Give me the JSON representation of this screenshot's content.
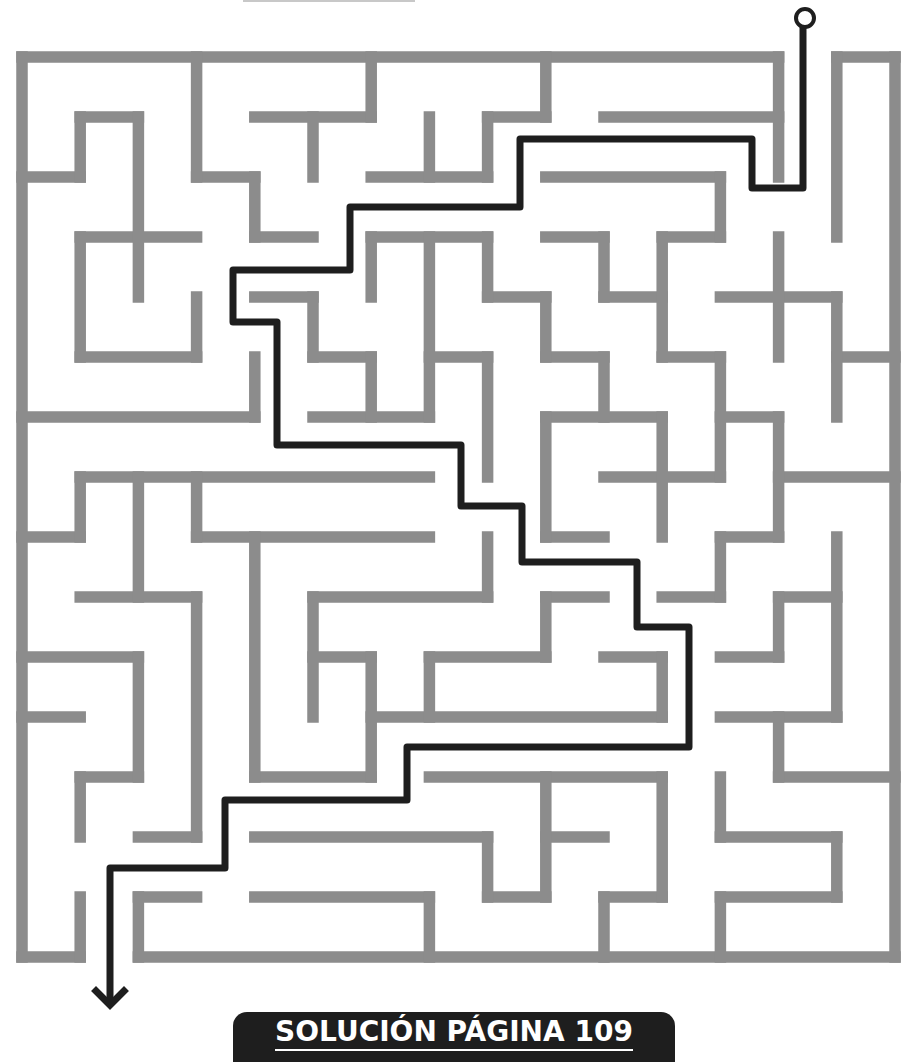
{
  "puzzle": {
    "type": "maze",
    "grid": {
      "cols": 15,
      "rows": 15
    },
    "wall_color": "#8c8c8c",
    "path_color": "#1e1e1e",
    "entrance": "top, between column lines 13 and 14",
    "exit": "bottom, between column lines 1 and 2"
  },
  "walls": {
    "horizontal": [
      [
        0,
        0,
        13
      ],
      [
        0,
        14,
        15
      ],
      [
        1,
        1,
        2
      ],
      [
        1,
        4,
        6
      ],
      [
        1,
        8,
        9
      ],
      [
        1,
        10,
        13
      ],
      [
        2,
        0,
        1
      ],
      [
        2,
        3,
        4
      ],
      [
        2,
        6,
        8
      ],
      [
        2,
        9,
        12
      ],
      [
        3,
        1,
        3
      ],
      [
        3,
        4,
        5
      ],
      [
        3,
        6,
        8
      ],
      [
        3,
        9,
        10
      ],
      [
        3,
        11,
        12
      ],
      [
        4,
        4,
        5
      ],
      [
        4,
        8,
        9
      ],
      [
        4,
        10,
        11
      ],
      [
        4,
        12,
        14
      ],
      [
        5,
        1,
        3
      ],
      [
        5,
        5,
        6
      ],
      [
        5,
        7,
        8
      ],
      [
        5,
        9,
        10
      ],
      [
        5,
        11,
        12
      ],
      [
        5,
        14,
        15
      ],
      [
        6,
        0,
        4
      ],
      [
        6,
        5,
        7
      ],
      [
        6,
        9,
        11
      ],
      [
        6,
        12,
        13
      ],
      [
        7,
        1,
        7
      ],
      [
        7,
        10,
        12
      ],
      [
        7,
        13,
        15
      ],
      [
        8,
        0,
        1
      ],
      [
        8,
        3,
        7
      ],
      [
        8,
        9,
        10
      ],
      [
        8,
        12,
        13
      ],
      [
        9,
        1,
        3
      ],
      [
        9,
        5,
        8
      ],
      [
        9,
        9,
        10
      ],
      [
        9,
        11,
        12
      ],
      [
        9,
        13,
        14
      ],
      [
        10,
        0,
        2
      ],
      [
        10,
        5,
        6
      ],
      [
        10,
        7,
        9
      ],
      [
        10,
        10,
        11
      ],
      [
        10,
        12,
        13
      ],
      [
        11,
        0,
        1
      ],
      [
        11,
        6,
        11
      ],
      [
        11,
        12,
        14
      ],
      [
        12,
        1,
        2
      ],
      [
        12,
        4,
        6
      ],
      [
        12,
        7,
        11
      ],
      [
        12,
        13,
        15
      ],
      [
        13,
        2,
        3
      ],
      [
        13,
        4,
        8
      ],
      [
        13,
        9,
        10
      ],
      [
        13,
        12,
        14
      ],
      [
        14,
        2,
        3
      ],
      [
        14,
        4,
        7
      ],
      [
        14,
        8,
        9
      ],
      [
        14,
        10,
        11
      ],
      [
        14,
        12,
        14
      ],
      [
        15,
        0,
        1
      ],
      [
        15,
        2,
        15
      ]
    ],
    "vertical": [
      [
        0,
        0,
        15
      ],
      [
        1,
        1,
        2
      ],
      [
        1,
        3,
        5
      ],
      [
        1,
        7,
        8
      ],
      [
        1,
        12,
        13
      ],
      [
        1,
        14,
        15
      ],
      [
        2,
        1,
        4
      ],
      [
        2,
        7,
        9
      ],
      [
        2,
        10,
        12
      ],
      [
        2,
        14,
        15
      ],
      [
        3,
        0,
        2
      ],
      [
        3,
        4,
        5
      ],
      [
        3,
        7,
        8
      ],
      [
        3,
        9,
        13
      ],
      [
        4,
        2,
        3
      ],
      [
        4,
        5,
        6
      ],
      [
        4,
        8,
        12
      ],
      [
        5,
        1,
        2
      ],
      [
        5,
        4,
        5
      ],
      [
        5,
        9,
        11
      ],
      [
        6,
        0,
        1
      ],
      [
        6,
        3,
        4
      ],
      [
        6,
        5,
        6
      ],
      [
        6,
        10,
        12
      ],
      [
        7,
        1,
        2
      ],
      [
        7,
        3,
        6
      ],
      [
        7,
        10,
        11
      ],
      [
        7,
        14,
        15
      ],
      [
        8,
        1,
        2
      ],
      [
        8,
        3,
        4
      ],
      [
        8,
        5,
        7
      ],
      [
        8,
        8,
        9
      ],
      [
        8,
        13,
        14
      ],
      [
        9,
        0,
        1
      ],
      [
        9,
        4,
        5
      ],
      [
        9,
        6,
        8
      ],
      [
        9,
        9,
        10
      ],
      [
        9,
        12,
        14
      ],
      [
        10,
        3,
        4
      ],
      [
        10,
        5,
        6
      ],
      [
        10,
        14,
        15
      ],
      [
        11,
        3,
        5
      ],
      [
        11,
        6,
        8
      ],
      [
        11,
        10,
        11
      ],
      [
        11,
        12,
        14
      ],
      [
        12,
        2,
        3
      ],
      [
        12,
        5,
        7
      ],
      [
        12,
        8,
        9
      ],
      [
        12,
        12,
        13
      ],
      [
        12,
        14,
        15
      ],
      [
        13,
        0,
        2
      ],
      [
        13,
        3,
        5
      ],
      [
        13,
        6,
        8
      ],
      [
        13,
        9,
        10
      ],
      [
        13,
        11,
        12
      ],
      [
        14,
        0,
        3
      ],
      [
        14,
        4,
        6
      ],
      [
        14,
        8,
        11
      ],
      [
        14,
        13,
        14
      ],
      [
        15,
        0,
        15
      ]
    ]
  },
  "solution_path": {
    "start": [
      805,
      18
    ],
    "points": [
      [
        803,
        27
      ],
      [
        803,
        188
      ],
      [
        752,
        188
      ],
      [
        752,
        139
      ],
      [
        520,
        139
      ],
      [
        520,
        207
      ],
      [
        350,
        207
      ],
      [
        350,
        270
      ],
      [
        233,
        270
      ],
      [
        233,
        322
      ],
      [
        277,
        322
      ],
      [
        277,
        445
      ],
      [
        461,
        445
      ],
      [
        461,
        506
      ],
      [
        522,
        506
      ],
      [
        522,
        562
      ],
      [
        637,
        562
      ],
      [
        637,
        627
      ],
      [
        689,
        627
      ],
      [
        689,
        747
      ],
      [
        407,
        747
      ],
      [
        407,
        800
      ],
      [
        225,
        800
      ],
      [
        225,
        868
      ],
      [
        110,
        868
      ],
      [
        110,
        1005
      ]
    ],
    "end_arrow": "arrow-down"
  },
  "footer": {
    "label": "SOLUCIÓN PÁGINA 109"
  }
}
